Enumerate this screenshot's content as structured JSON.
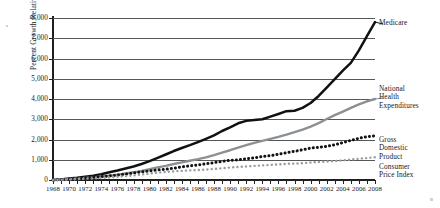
{
  "chart_data": {
    "type": "line",
    "title": "",
    "xlabel": "",
    "ylabel": "Percent Growth Relative to 1968",
    "ylim": [
      0,
      8000
    ],
    "ytick_values": [
      0,
      1000,
      2000,
      3000,
      4000,
      5000,
      6000,
      7000,
      8000
    ],
    "ytick_labels": [
      "0",
      "1,000",
      "2,000",
      "3,000",
      "4,000",
      "5,000",
      "6,000",
      "7,000",
      "8,000"
    ],
    "grid": true,
    "legend_position": "right-inline-callouts",
    "xlim": [
      1968,
      2008
    ],
    "xtick_labels": [
      "1968",
      "1970",
      "1972",
      "1974",
      "1976",
      "1978",
      "1980",
      "1982",
      "1984",
      "1986",
      "1988",
      "1990",
      "1992",
      "1994",
      "1996",
      "1998",
      "2000",
      "2002",
      "2004",
      "2006",
      "2008"
    ],
    "x": [
      1968,
      1969,
      1970,
      1971,
      1972,
      1973,
      1974,
      1975,
      1976,
      1977,
      1978,
      1979,
      1980,
      1981,
      1982,
      1983,
      1984,
      1985,
      1986,
      1987,
      1988,
      1989,
      1990,
      1991,
      1992,
      1993,
      1994,
      1995,
      1996,
      1997,
      1998,
      1999,
      2000,
      2001,
      2002,
      2003,
      2004,
      2005,
      2006,
      2007,
      2008
    ],
    "series": [
      {
        "name": "Medicare",
        "label": "Medicare",
        "style": "solid-thick",
        "color": "#111111",
        "values": [
          0,
          30,
          70,
          110,
          160,
          215,
          285,
          380,
          470,
          570,
          670,
          790,
          930,
          1090,
          1260,
          1430,
          1580,
          1720,
          1870,
          2030,
          2200,
          2420,
          2600,
          2800,
          2920,
          2960,
          3000,
          3130,
          3260,
          3400,
          3420,
          3560,
          3800,
          4150,
          4560,
          4980,
          5400,
          5780,
          6400,
          7100,
          7800
        ]
      },
      {
        "name": "National Health Expenditures",
        "label": "National\nHealth\nExpenditures",
        "style": "solid-gray",
        "color": "#8d9093",
        "values": [
          0,
          20,
          45,
          70,
          100,
          130,
          170,
          215,
          265,
          320,
          380,
          450,
          530,
          620,
          700,
          790,
          870,
          950,
          1030,
          1120,
          1230,
          1350,
          1470,
          1600,
          1720,
          1830,
          1930,
          2030,
          2130,
          2240,
          2360,
          2490,
          2640,
          2810,
          3010,
          3200,
          3380,
          3560,
          3730,
          3880,
          4000
        ]
      },
      {
        "name": "Gross Domestic Product",
        "label": "Gross\nDomestic\nProduct",
        "style": "dotted-black",
        "color": "#131313",
        "values": [
          0,
          20,
          40,
          65,
          95,
          130,
          165,
          200,
          240,
          290,
          345,
          400,
          445,
          500,
          530,
          580,
          650,
          700,
          745,
          800,
          860,
          920,
          970,
          1000,
          1045,
          1095,
          1155,
          1205,
          1270,
          1345,
          1415,
          1490,
          1575,
          1615,
          1665,
          1740,
          1845,
          1955,
          2060,
          2140,
          2180
        ]
      },
      {
        "name": "Consumer Price Index",
        "label": "Consumer\nPrice Index",
        "style": "dotted-gray",
        "color": "#9a9d9f",
        "values": [
          0,
          15,
          30,
          45,
          60,
          80,
          105,
          135,
          160,
          190,
          225,
          270,
          320,
          365,
          400,
          425,
          450,
          475,
          490,
          515,
          545,
          580,
          615,
          645,
          670,
          695,
          720,
          745,
          770,
          795,
          810,
          830,
          865,
          890,
          910,
          935,
          970,
          1010,
          1050,
          1085,
          1125
        ]
      }
    ]
  }
}
